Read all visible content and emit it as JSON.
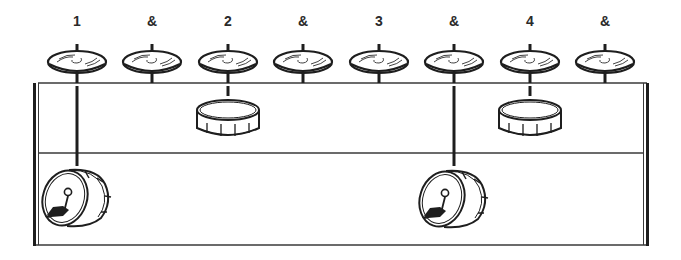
{
  "diagram": {
    "title": "",
    "type": "drum-beat-notation",
    "colors": {
      "ink": "#1e1e1e",
      "line": "#3a3a3a",
      "background": "#ffffff"
    },
    "counts": [
      {
        "label": "1",
        "x": 77
      },
      {
        "label": "&",
        "x": 152
      },
      {
        "label": "2",
        "x": 228
      },
      {
        "label": "&",
        "x": 303
      },
      {
        "label": "3",
        "x": 379
      },
      {
        "label": "&",
        "x": 454
      },
      {
        "label": "4",
        "x": 530
      },
      {
        "label": "&",
        "x": 605
      }
    ],
    "staff": {
      "left": 33,
      "right": 649,
      "top_line_y": 83,
      "middle_line_y": 153,
      "bottom_line_y": 245
    },
    "hihat": {
      "name": "hi-hat",
      "y": 60,
      "hits": [
        "1",
        "&",
        "2",
        "&",
        "3",
        "&",
        "4",
        "&"
      ]
    },
    "snare": {
      "name": "snare drum",
      "hits": [
        {
          "count": "2",
          "x": 228
        },
        {
          "count": "4",
          "x": 530
        }
      ]
    },
    "kick": {
      "name": "bass drum",
      "hits": [
        {
          "count": "1",
          "x": 77
        },
        {
          "count": "&",
          "x": 454
        }
      ]
    }
  }
}
